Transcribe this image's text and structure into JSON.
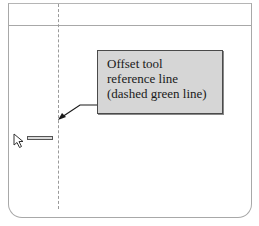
{
  "callout": {
    "lines": [
      "Offset tool",
      "reference line",
      "(dashed green line)"
    ]
  },
  "canvas": {
    "reference_line_style": "dashed",
    "reference_line_color": "#9a9a9a"
  },
  "cursor": {
    "icon": "arrow-pointer-icon",
    "tooltip_label": ""
  },
  "colors": {
    "callout_bg": "#d6d6d6",
    "callout_border": "#4a4a4a",
    "frame_border": "#a8a8a8"
  }
}
